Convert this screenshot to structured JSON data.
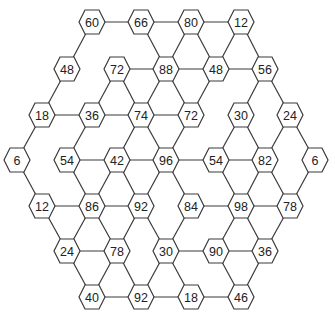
{
  "diagram": {
    "type": "hexagon-number-network",
    "colors": {
      "stroke": "#3a3a3a",
      "fill": "#ffffff",
      "text": "#222222"
    },
    "nodes": [
      {
        "id": "n60",
        "label": "60",
        "x": 92,
        "y": 22
      },
      {
        "id": "n66",
        "label": "66",
        "x": 141,
        "y": 22
      },
      {
        "id": "n80",
        "label": "80",
        "x": 191,
        "y": 22
      },
      {
        "id": "n12a",
        "label": "12",
        "x": 241,
        "y": 22
      },
      {
        "id": "n48a",
        "label": "48",
        "x": 67,
        "y": 69
      },
      {
        "id": "n72a",
        "label": "72",
        "x": 117,
        "y": 69
      },
      {
        "id": "n88",
        "label": "88",
        "x": 166,
        "y": 69
      },
      {
        "id": "n48b",
        "label": "48",
        "x": 216,
        "y": 69
      },
      {
        "id": "n56",
        "label": "56",
        "x": 265,
        "y": 69
      },
      {
        "id": "n18a",
        "label": "18",
        "x": 42,
        "y": 115
      },
      {
        "id": "n36a",
        "label": "36",
        "x": 92,
        "y": 115
      },
      {
        "id": "n74",
        "label": "74",
        "x": 141,
        "y": 115
      },
      {
        "id": "n72b",
        "label": "72",
        "x": 191,
        "y": 115
      },
      {
        "id": "n30a",
        "label": "30",
        "x": 241,
        "y": 115
      },
      {
        "id": "n24a",
        "label": "24",
        "x": 290,
        "y": 115
      },
      {
        "id": "n6a",
        "label": "6",
        "x": 17,
        "y": 160
      },
      {
        "id": "n54a",
        "label": "54",
        "x": 67,
        "y": 160
      },
      {
        "id": "n42",
        "label": "42",
        "x": 117,
        "y": 160
      },
      {
        "id": "n96",
        "label": "96",
        "x": 166,
        "y": 160
      },
      {
        "id": "n54b",
        "label": "54",
        "x": 216,
        "y": 160
      },
      {
        "id": "n82",
        "label": "82",
        "x": 265,
        "y": 160
      },
      {
        "id": "n6b",
        "label": "6",
        "x": 315,
        "y": 160
      },
      {
        "id": "n12b",
        "label": "12",
        "x": 42,
        "y": 206
      },
      {
        "id": "n86",
        "label": "86",
        "x": 92,
        "y": 206
      },
      {
        "id": "n92a",
        "label": "92",
        "x": 141,
        "y": 206
      },
      {
        "id": "n84",
        "label": "84",
        "x": 191,
        "y": 206
      },
      {
        "id": "n98",
        "label": "98",
        "x": 241,
        "y": 206
      },
      {
        "id": "n78b",
        "label": "78",
        "x": 290,
        "y": 206
      },
      {
        "id": "n24b",
        "label": "24",
        "x": 67,
        "y": 251
      },
      {
        "id": "n78a",
        "label": "78",
        "x": 117,
        "y": 251
      },
      {
        "id": "n30b",
        "label": "30",
        "x": 166,
        "y": 251
      },
      {
        "id": "n90",
        "label": "90",
        "x": 216,
        "y": 251
      },
      {
        "id": "n36b",
        "label": "36",
        "x": 265,
        "y": 251
      },
      {
        "id": "n40",
        "label": "40",
        "x": 92,
        "y": 297
      },
      {
        "id": "n92b",
        "label": "92",
        "x": 141,
        "y": 297
      },
      {
        "id": "n18b",
        "label": "18",
        "x": 191,
        "y": 297
      },
      {
        "id": "n46",
        "label": "46",
        "x": 241,
        "y": 297
      }
    ],
    "edges": [
      [
        "n60",
        "n66"
      ],
      [
        "n66",
        "n80"
      ],
      [
        "n80",
        "n12a"
      ],
      [
        "n60",
        "n48a"
      ],
      [
        "n66",
        "n88"
      ],
      [
        "n80",
        "n88"
      ],
      [
        "n80",
        "n48b"
      ],
      [
        "n12a",
        "n48b"
      ],
      [
        "n12a",
        "n56"
      ],
      [
        "n72a",
        "n88"
      ],
      [
        "n88",
        "n48b"
      ],
      [
        "n48b",
        "n56"
      ],
      [
        "n48a",
        "n18a"
      ],
      [
        "n72a",
        "n36a"
      ],
      [
        "n72a",
        "n74"
      ],
      [
        "n88",
        "n74"
      ],
      [
        "n88",
        "n72b"
      ],
      [
        "n48b",
        "n72b"
      ],
      [
        "n56",
        "n30a"
      ],
      [
        "n56",
        "n24a"
      ],
      [
        "n18a",
        "n36a"
      ],
      [
        "n36a",
        "n74"
      ],
      [
        "n74",
        "n72b"
      ],
      [
        "n18a",
        "n6a"
      ],
      [
        "n36a",
        "n54a"
      ],
      [
        "n74",
        "n42"
      ],
      [
        "n74",
        "n96"
      ],
      [
        "n72b",
        "n96"
      ],
      [
        "n30a",
        "n54b"
      ],
      [
        "n30a",
        "n82"
      ],
      [
        "n24a",
        "n82"
      ],
      [
        "n24a",
        "n6b"
      ],
      [
        "n54a",
        "n42"
      ],
      [
        "n42",
        "n96"
      ],
      [
        "n96",
        "n54b"
      ],
      [
        "n54b",
        "n82"
      ],
      [
        "n6a",
        "n12b"
      ],
      [
        "n54a",
        "n86"
      ],
      [
        "n42",
        "n86"
      ],
      [
        "n42",
        "n92a"
      ],
      [
        "n96",
        "n92a"
      ],
      [
        "n96",
        "n84"
      ],
      [
        "n54b",
        "n98"
      ],
      [
        "n82",
        "n98"
      ],
      [
        "n82",
        "n78b"
      ],
      [
        "n6b",
        "n78b"
      ],
      [
        "n12b",
        "n86"
      ],
      [
        "n86",
        "n92a"
      ],
      [
        "n84",
        "n98"
      ],
      [
        "n98",
        "n78b"
      ],
      [
        "n12b",
        "n24b"
      ],
      [
        "n86",
        "n24b"
      ],
      [
        "n86",
        "n78a"
      ],
      [
        "n92a",
        "n78a"
      ],
      [
        "n92a",
        "n30b"
      ],
      [
        "n84",
        "n30b"
      ],
      [
        "n98",
        "n90"
      ],
      [
        "n98",
        "n36b"
      ],
      [
        "n78b",
        "n36b"
      ],
      [
        "n24b",
        "n78a"
      ],
      [
        "n30b",
        "n90"
      ],
      [
        "n90",
        "n36b"
      ],
      [
        "n24b",
        "n40"
      ],
      [
        "n78a",
        "n40"
      ],
      [
        "n78a",
        "n92b"
      ],
      [
        "n30b",
        "n92b"
      ],
      [
        "n30b",
        "n18b"
      ],
      [
        "n90",
        "n46"
      ],
      [
        "n36b",
        "n46"
      ],
      [
        "n40",
        "n92b"
      ],
      [
        "n92b",
        "n18b"
      ],
      [
        "n18b",
        "n46"
      ]
    ]
  }
}
